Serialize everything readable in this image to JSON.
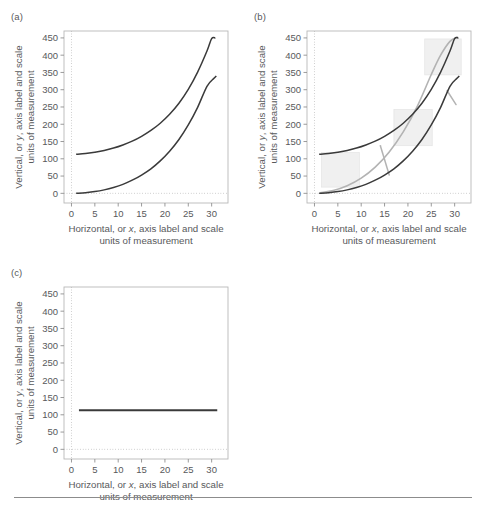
{
  "figure": {
    "width": 486,
    "height": 512,
    "background": "#ffffff",
    "has_bottom_rule": true
  },
  "panels": [
    {
      "key": "a",
      "label": "(a)"
    },
    {
      "key": "b",
      "label": "(b)"
    },
    {
      "key": "c",
      "label": "(c)"
    }
  ],
  "axes": {
    "x_title_line1_pre": "Horizontal, or ",
    "x_title_line1_italic": "x",
    "x_title_line1_post": ", axis label and scale",
    "x_title_line2": "units of measurement",
    "y_title_line1_pre": "Vertical, or ",
    "y_title_line1_italic": "y",
    "y_title_line1_post": ", axis label and scale",
    "y_title_line2": "units of measurement",
    "x_ticks": [
      "0",
      "5",
      "10",
      "15",
      "20",
      "25",
      "30"
    ],
    "y_ticks": [
      "0",
      "50",
      "100",
      "150",
      "200",
      "250",
      "300",
      "350",
      "400",
      "450"
    ],
    "xlim": [
      -1.6,
      33.5
    ],
    "ylim": [
      -28,
      470
    ],
    "grid_at_x": 0,
    "grid_at_y": 0
  },
  "colors": {
    "curve_dark": "#3a3a3a",
    "curve_gray": "#b3b3b3",
    "box_fill": "#f0f0f0",
    "frame": "#b8b8b8",
    "grid_dotted": "#b0b0b0",
    "tick": "#909090",
    "text": "#58595b",
    "rule": "#8c8c8c"
  },
  "chart_data": {
    "type": "line",
    "title": "",
    "xlabel": "Horizontal, or x, axis label and scale units of measurement",
    "ylabel": "Vertical, or y, axis label and scale units of measurement",
    "xlim": [
      -1.6,
      33.5
    ],
    "ylim": [
      -28,
      470
    ],
    "xticks": [
      0,
      5,
      10,
      15,
      20,
      25,
      30
    ],
    "yticks": [
      0,
      50,
      100,
      150,
      200,
      250,
      300,
      350,
      400,
      450
    ],
    "grid": "dotted reference lines at x=0 and y=0 only",
    "legend": "none",
    "panels": [
      {
        "panel": "(a)",
        "series": [
          {
            "name": "upper-curve",
            "color": "#3a3a3a",
            "x": [
              1,
              3,
              5,
              7,
              9,
              11,
              13,
              15,
              17,
              19,
              21,
              23,
              25,
              27,
              29,
              30,
              30.8
            ],
            "y": [
              113,
              115,
              119,
              124,
              131,
              140,
              151,
              165,
              182,
              203,
              229,
              261,
              301,
              351,
              412,
              448,
              450
            ]
          },
          {
            "name": "lower-curve",
            "color": "#3a3a3a",
            "x": [
              1,
              3,
              5,
              7,
              9,
              11,
              13,
              15,
              17,
              19,
              21,
              23,
              25,
              27,
              29,
              30.5,
              31
            ],
            "y": [
              0,
              2,
              5,
              10,
              17,
              26,
              38,
              53,
              71,
              94,
              122,
              156,
              198,
              249,
              310,
              333,
              340
            ]
          }
        ]
      },
      {
        "panel": "(b)",
        "series": [
          {
            "name": "upper-curve",
            "color": "#3a3a3a",
            "x": [
              1,
              3,
              5,
              7,
              9,
              11,
              13,
              15,
              17,
              19,
              21,
              23,
              25,
              27,
              29,
              30,
              30.8
            ],
            "y": [
              113,
              115,
              119,
              124,
              131,
              140,
              151,
              165,
              182,
              203,
              229,
              261,
              301,
              351,
              412,
              448,
              450
            ]
          },
          {
            "name": "lower-curve",
            "color": "#3a3a3a",
            "x": [
              1,
              3,
              5,
              7,
              9,
              11,
              13,
              15,
              17,
              19,
              21,
              23,
              25,
              27,
              29,
              30.5,
              31
            ],
            "y": [
              0,
              2,
              5,
              10,
              17,
              26,
              38,
              53,
              71,
              94,
              122,
              156,
              198,
              249,
              310,
              333,
              340
            ]
          },
          {
            "name": "middle-gray-curve",
            "color": "#b3b3b3",
            "x": [
              1.4,
              4,
              7,
              10,
              13,
              16,
              19,
              22,
              25,
              27,
              29,
              30.6
            ],
            "y": [
              2,
              8,
              22,
              44,
              76,
              120,
              178,
              252,
              344,
              400,
              440,
              452
            ]
          }
        ],
        "annotation_boxes": [
          {
            "name": "box-lower-left",
            "x0": 1.5,
            "x1": 9.6,
            "y0": 18,
            "y1": 118,
            "fill": "#f0f0f0"
          },
          {
            "name": "box-middle",
            "x0": 17.0,
            "x1": 25.2,
            "y0": 138,
            "y1": 243,
            "fill": "#f0f0f0"
          },
          {
            "name": "box-upper-right",
            "x0": 23.6,
            "x1": 31.4,
            "y0": 343,
            "y1": 447,
            "fill": "#f0f0f0"
          }
        ],
        "connector_segments": [
          {
            "name": "connector-lower",
            "x0": 14.1,
            "y0": 138,
            "x1": 16.0,
            "y1": 53,
            "color": "#b3b3b3"
          },
          {
            "name": "connector-upper",
            "x0": 28.4,
            "y0": 297,
            "x1": 30.3,
            "y1": 257,
            "color": "#b3b3b3"
          }
        ]
      },
      {
        "panel": "(c)",
        "series": [
          {
            "name": "flat-line",
            "color": "#3a3a3a",
            "x": [
              1.6,
              31.2
            ],
            "y": [
              113,
              113
            ]
          }
        ]
      }
    ]
  }
}
